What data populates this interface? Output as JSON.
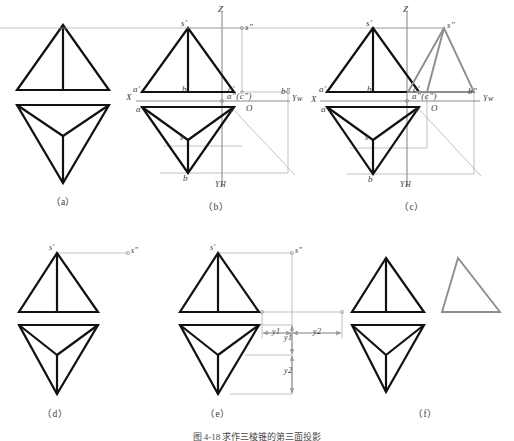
{
  "figure": {
    "title_caption": "图 4-18  求作三棱锥的第三面投影",
    "panels": [
      {
        "id": "a",
        "label": "（a）"
      },
      {
        "id": "b",
        "label": "（b）"
      },
      {
        "id": "c",
        "label": "（c）"
      },
      {
        "id": "d",
        "label": "（d）"
      },
      {
        "id": "e",
        "label": "（e）"
      },
      {
        "id": "f",
        "label": "（f）"
      }
    ]
  },
  "colors": {
    "object_line": "#111111",
    "thin_line": "#9a9a9a",
    "axis_line": "#8c8c8c",
    "new_projection": "#8d8d8d",
    "text": "#3b3b3b",
    "background": "#ffffff"
  },
  "panel_b": {
    "axis_labels": {
      "z": "Z",
      "x": "X",
      "origin": "O",
      "y_w": "Yw",
      "y_h": "YH"
    },
    "point_labels": {
      "s_front": "s'",
      "s_side": "s\"",
      "a_front": "a'",
      "b_front": "b'",
      "c_front": "c'",
      "a_side": "a\"(c\")",
      "b_side": "b\"",
      "a_top": "a",
      "c_top": "c",
      "s_top": "s",
      "b_top": "b"
    }
  },
  "panel_c": {
    "axis_labels": {
      "z": "Z",
      "x": "X",
      "origin": "O",
      "y_w": "Yw",
      "y_h": "YH"
    },
    "point_labels": {
      "s_front": "s'",
      "s_side": "s\"",
      "a_front": "a'",
      "b_front": "b'",
      "c_front": "c'",
      "a_side": "a\"(c\")",
      "b_side": "b\"",
      "a_top": "a",
      "c_top": "c",
      "s_top": "s",
      "b_top": "b"
    }
  },
  "panel_d": {
    "point_labels": {
      "s_front": "s'",
      "s_side": "s\""
    }
  },
  "panel_e": {
    "point_labels": {
      "s_front": "s'",
      "s_side": "s\""
    },
    "dimensions": {
      "y1": "y1",
      "y2": "y2",
      "y1_v": "y1",
      "y2_v": "y2"
    }
  }
}
